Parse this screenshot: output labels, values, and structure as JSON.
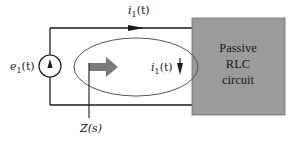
{
  "diagram": {
    "type": "circuit",
    "source": {
      "label": "e",
      "subscript": "1",
      "suffix": "(t)",
      "symbol": "current-source-up-arrow"
    },
    "top_current": {
      "label": "i",
      "subscript": "1",
      "suffix": "(t)",
      "direction": "right"
    },
    "loop_current": {
      "label": "i",
      "subscript": "1",
      "suffix": "(t)",
      "direction": "down"
    },
    "impedance": {
      "label": "Z(s)"
    },
    "block": {
      "lines": [
        "Passive",
        "RLC",
        "circuit"
      ],
      "fill": "#9b9b9b"
    },
    "colors": {
      "wire": "#1a1a1a",
      "ellipse": "#555555",
      "arrow": "#7a7a7a"
    }
  }
}
